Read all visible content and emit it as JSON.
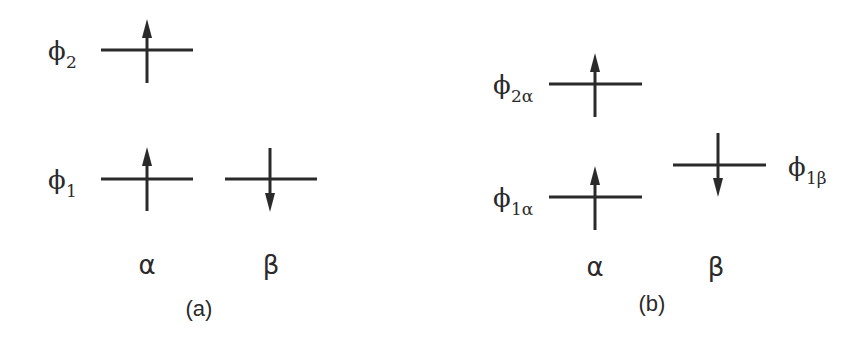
{
  "diagram": {
    "type": "orbital-energy-level-diagram",
    "colors": {
      "ink": "#2a2a2a",
      "background": "#ffffff"
    },
    "panels": [
      {
        "id": "a",
        "caption": "(a)",
        "column_labels": {
          "alpha": "α",
          "beta": "β"
        },
        "levels": [
          {
            "label_main": "ϕ",
            "label_sub": "2",
            "spins": [
              "up"
            ]
          },
          {
            "label_main": "ϕ",
            "label_sub": "1",
            "spins": [
              "up",
              "down"
            ]
          }
        ]
      },
      {
        "id": "b",
        "caption": "(b)",
        "column_labels": {
          "alpha": "α",
          "beta": "β"
        },
        "levels": [
          {
            "label_main": "ϕ",
            "label_sub": "2α",
            "column": "alpha",
            "spin": "up"
          },
          {
            "label_main": "ϕ",
            "label_sub": "1β",
            "column": "beta",
            "spin": "down"
          },
          {
            "label_main": "ϕ",
            "label_sub": "1α",
            "column": "alpha",
            "spin": "up"
          }
        ]
      }
    ]
  }
}
